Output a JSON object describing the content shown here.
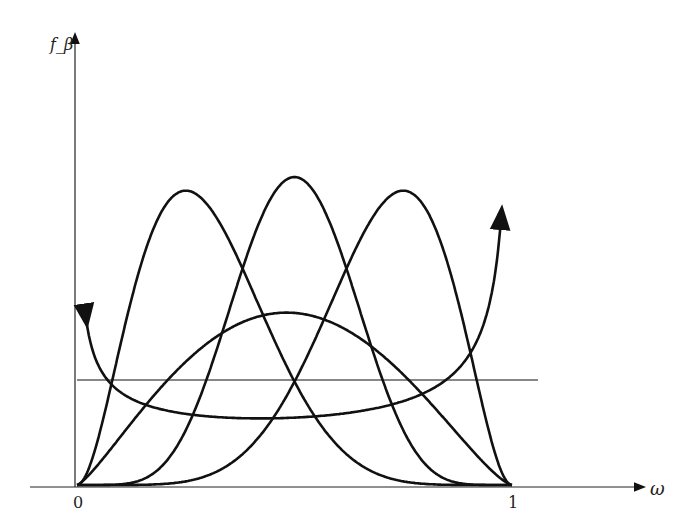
{
  "chart_data": {
    "type": "line",
    "title": "",
    "xlabel": "ω",
    "ylabel": "f_β",
    "x_ticks": [
      "0",
      "1"
    ],
    "xlim": [
      0,
      1
    ],
    "grid": false,
    "legend": "none",
    "series": [
      {
        "name": "uniform",
        "kind": "beta",
        "a": 1,
        "b": 1
      },
      {
        "name": "skewed-left-peak",
        "kind": "beta",
        "a": 3,
        "b": 7
      },
      {
        "name": "symmetric-peak",
        "kind": "beta",
        "a": 7,
        "b": 7
      },
      {
        "name": "skewed-right-peak",
        "kind": "beta",
        "a": 7,
        "b": 3
      },
      {
        "name": "wide-arc",
        "kind": "beta",
        "a": 2.3,
        "b": 2.4
      },
      {
        "name": "u-shaped",
        "kind": "beta",
        "a": 0.6,
        "b": 0.45,
        "unbounded_ends": true
      }
    ]
  }
}
